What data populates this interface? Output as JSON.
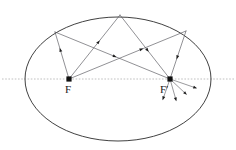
{
  "figure": {
    "background_color": "#ffffff",
    "width": 236,
    "height": 150
  },
  "labels": {
    "focus_left": "F",
    "focus_right": "F′"
  },
  "colors": {
    "ellipse_stroke": "#2b2b2b",
    "axis_stroke": "#b9b9b9",
    "ray_stroke": "#55555b",
    "focus_fill": "#101010",
    "label_fill": "#1a1a1a"
  },
  "chart_data": {
    "type": "diagram",
    "xlabel": "",
    "ylabel": "",
    "ellipse": {
      "center": [
        118,
        79
      ],
      "semi_major_x": 93,
      "semi_minor_y": 62
    },
    "major_axis": {
      "y": 79,
      "x_start": 2,
      "x_end": 234,
      "style": "dotted",
      "color": "#b9b9b9"
    },
    "foci": [
      {
        "name": "F",
        "x": 69,
        "y": 79,
        "label": "F",
        "label_x": 65,
        "label_y": 93
      },
      {
        "name": "F'",
        "x": 170,
        "y": 79,
        "label": "F′",
        "label_x": 160,
        "label_y": 93
      }
    ],
    "reflection_points": [
      {
        "id": "P1",
        "x": 55,
        "y": 32
      },
      {
        "id": "P2",
        "x": 120,
        "y": 15
      },
      {
        "id": "P3",
        "x": 186,
        "y": 31
      }
    ],
    "rays": [
      {
        "from": "F",
        "to": "P1",
        "x1": 69,
        "y1": 79,
        "x2": 55,
        "y2": 32,
        "marker_t": 0.62
      },
      {
        "from": "P1",
        "to": "F'",
        "x1": 55,
        "y1": 32,
        "x2": 170,
        "y2": 79,
        "marker_t": 0.52
      },
      {
        "from": "F",
        "to": "P2",
        "x1": 69,
        "y1": 79,
        "x2": 120,
        "y2": 15,
        "marker_t": 0.58
      },
      {
        "from": "P2",
        "to": "F'",
        "x1": 120,
        "y1": 15,
        "x2": 170,
        "y2": 79,
        "marker_t": 0.55
      },
      {
        "from": "F",
        "to": "P3",
        "x1": 69,
        "y1": 79,
        "x2": 186,
        "y2": 31,
        "marker_t": 0.62
      },
      {
        "from": "P3",
        "to": "F'",
        "x1": 186,
        "y1": 31,
        "x2": 170,
        "y2": 79,
        "marker_t": 0.55
      }
    ],
    "outgoing_stubs": [
      {
        "from": "F'",
        "x1": 170,
        "y1": 79,
        "x2": 196,
        "y2": 88,
        "marker_t": 1.0
      },
      {
        "from": "F'",
        "x1": 170,
        "y1": 79,
        "x2": 186,
        "y2": 94,
        "marker_t": 1.0
      },
      {
        "from": "F'",
        "x1": 170,
        "y1": 79,
        "x2": 176,
        "y2": 100,
        "marker_t": 1.0
      },
      {
        "from": "F'",
        "x1": 170,
        "y1": 79,
        "x2": 163,
        "y2": 99,
        "marker_t": 1.0
      }
    ]
  }
}
